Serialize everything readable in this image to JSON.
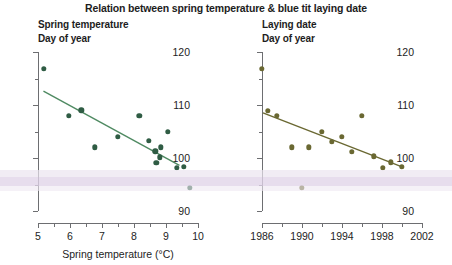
{
  "figure": {
    "title": "Relation between spring temperature & blue tit laying date",
    "marker_color_left": "#2f5c44",
    "marker_color_right": "#6a6832",
    "axis_color": "#6d6e71"
  },
  "chart_data": [
    {
      "type": "scatter",
      "panel": "left",
      "title": "Spring temperature",
      "subtitle": "Day of year",
      "xlabel": "Spring temperature (°C)",
      "ylabel": "Day of year",
      "xlim": [
        5,
        10
      ],
      "ylim": [
        90,
        120
      ],
      "xticks": [
        5,
        6,
        7,
        8,
        9,
        10
      ],
      "xticklabels": [
        "5",
        "6",
        "7",
        "8",
        "9",
        "10"
      ],
      "xminor_step": 0.5,
      "yticks": [
        90,
        100,
        110,
        120
      ],
      "yticklabels": [
        "90",
        "100",
        "110",
        "120"
      ],
      "yminor": [
        95,
        105,
        115
      ],
      "grid": false,
      "legend": "none",
      "points": [
        {
          "x": 5.18,
          "y": 116.8
        },
        {
          "x": 5.97,
          "y": 108.0
        },
        {
          "x": 6.35,
          "y": 109.0
        },
        {
          "x": 6.78,
          "y": 102.0
        },
        {
          "x": 7.5,
          "y": 104.0
        },
        {
          "x": 8.17,
          "y": 108.0
        },
        {
          "x": 8.47,
          "y": 103.2
        },
        {
          "x": 8.67,
          "y": 101.3
        },
        {
          "x": 8.7,
          "y": 99.1
        },
        {
          "x": 8.8,
          "y": 100.1
        },
        {
          "x": 8.83,
          "y": 102.0
        },
        {
          "x": 9.05,
          "y": 105.0
        },
        {
          "x": 9.33,
          "y": 98.2
        },
        {
          "x": 9.56,
          "y": 98.3
        },
        {
          "x": 9.75,
          "y": 94.4
        }
      ],
      "trendline": {
        "x0": 5.17,
        "y0": 112.6,
        "x1": 9.42,
        "y1": 98.6
      },
      "trend_color": "#4f8a62"
    },
    {
      "type": "scatter",
      "panel": "right",
      "title": "Laying date",
      "subtitle": "Day of year",
      "xlabel": "",
      "ylabel": "Day of year",
      "xlim": [
        1986,
        2002
      ],
      "ylim": [
        90,
        120
      ],
      "xticks": [
        1986,
        1988,
        1990,
        1992,
        1994,
        1996,
        1998,
        2000,
        2002
      ],
      "xticklabels": [
        "1986",
        "",
        "1990",
        "",
        "1994",
        "",
        "1998",
        "",
        "2002"
      ],
      "yticks": [
        90,
        100,
        110,
        120
      ],
      "yticklabels": [
        "90",
        "100",
        "110",
        "120"
      ],
      "yminor": [
        95,
        105,
        115
      ],
      "grid": false,
      "legend": "none",
      "points": [
        {
          "x": 1986.0,
          "y": 116.8
        },
        {
          "x": 1986.6,
          "y": 108.9
        },
        {
          "x": 1987.5,
          "y": 108.0
        },
        {
          "x": 1989.0,
          "y": 102.0
        },
        {
          "x": 1990.0,
          "y": 94.4
        },
        {
          "x": 1990.7,
          "y": 102.0
        },
        {
          "x": 1992.0,
          "y": 105.0
        },
        {
          "x": 1993.0,
          "y": 103.1
        },
        {
          "x": 1994.0,
          "y": 104.0
        },
        {
          "x": 1995.0,
          "y": 101.2
        },
        {
          "x": 1996.0,
          "y": 108.0
        },
        {
          "x": 1997.2,
          "y": 100.3
        },
        {
          "x": 1998.1,
          "y": 98.2
        },
        {
          "x": 1998.9,
          "y": 99.2
        },
        {
          "x": 2000.0,
          "y": 98.3
        }
      ],
      "trendline": {
        "x0": 1986.1,
        "y0": 108.5,
        "x1": 2000.2,
        "y1": 98.2
      },
      "trend_color": "#6a6832"
    }
  ]
}
